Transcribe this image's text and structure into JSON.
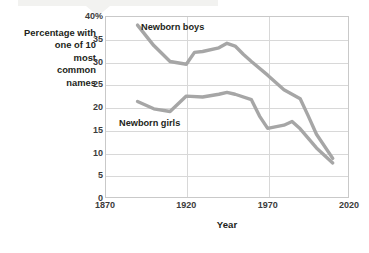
{
  "figure": {
    "name": "newborn-common-names-chart"
  },
  "axes": {
    "y_label_lines": [
      "Percentage with",
      "one of 10",
      "most",
      "common",
      "names"
    ],
    "x_title": "Year"
  },
  "labels": {
    "boys": "Newborn boys",
    "girls": "Newborn girls"
  },
  "colors": {
    "line": "#a6a6a6",
    "grid": "#d8d8d8",
    "frame": "#c9c9c9",
    "text": "#231f20"
  },
  "chart_data": {
    "type": "line",
    "title": "",
    "subtitle": "",
    "xlabel": "Year",
    "ylabel": "Percentage with one of 10 most common names",
    "xlim": [
      1870,
      2020
    ],
    "ylim": [
      0,
      40
    ],
    "xticks": [
      1870,
      1920,
      1970,
      2020
    ],
    "xticklabels": [
      "1870",
      "1920",
      "1970",
      "2020"
    ],
    "yticks": [
      0,
      5,
      10,
      15,
      20,
      25,
      30,
      35,
      40
    ],
    "yticklabels": [
      "0",
      "5",
      "10",
      "15",
      "20",
      "25",
      "30",
      "35",
      "40%"
    ],
    "grid": true,
    "grid_axis": "both",
    "legend": "inline-annotations",
    "legend_position": "inside-plot",
    "series": [
      {
        "name": "Newborn boys",
        "color": "#a6a6a6",
        "x": [
          1890,
          1900,
          1910,
          1920,
          1925,
          1930,
          1940,
          1945,
          1950,
          1955,
          1960,
          1970,
          1980,
          1990,
          1995,
          2000,
          2010
        ],
        "values": [
          38.0,
          33.5,
          30.0,
          29.4,
          32.0,
          32.2,
          33.0,
          34.0,
          33.4,
          31.6,
          30.0,
          27.0,
          23.8,
          21.8,
          18.0,
          14.0,
          8.7
        ]
      },
      {
        "name": "Newborn girls",
        "color": "#a6a6a6",
        "x": [
          1890,
          1900,
          1910,
          1920,
          1930,
          1940,
          1945,
          1950,
          1960,
          1965,
          1970,
          1980,
          1985,
          1990,
          2000,
          2010
        ],
        "values": [
          21.2,
          19.6,
          19.0,
          22.4,
          22.2,
          22.8,
          23.2,
          22.8,
          21.6,
          18.0,
          15.3,
          16.0,
          16.8,
          15.2,
          11.0,
          7.7
        ]
      }
    ],
    "annotations": [
      {
        "text": "Newborn boys",
        "x": 1925,
        "y": 37.0
      },
      {
        "text": "Newborn girls",
        "x": 1905,
        "y": 17.0
      }
    ]
  }
}
